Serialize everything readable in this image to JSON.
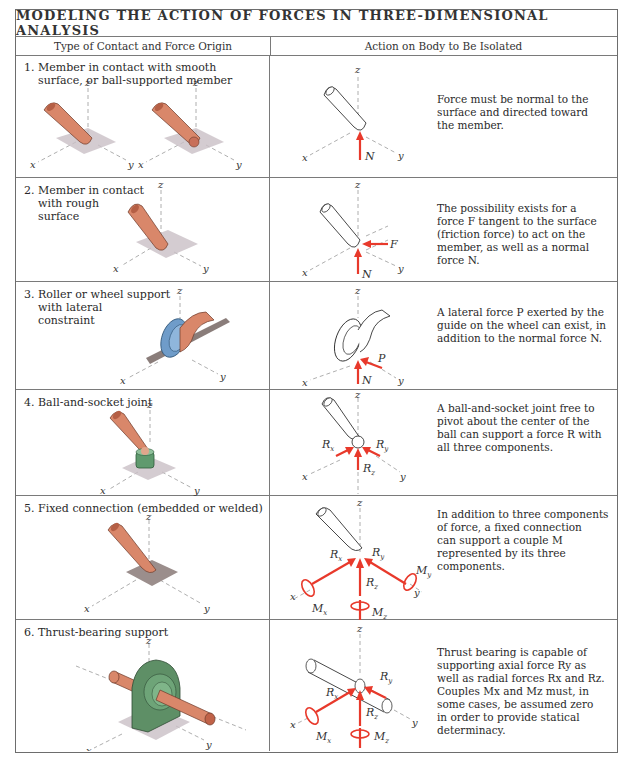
{
  "table": {
    "title": "MODELING THE ACTION OF FORCES IN THREE-DIMENSIONAL ANALYSIS",
    "headers": [
      "Type of Contact and Force Origin",
      "Action on Body to Be Isolated"
    ]
  },
  "rows": [
    {
      "number": "1.",
      "contact_lines": [
        "Member in contact with smooth",
        "surface, or ball-supported member"
      ],
      "action_lines": [
        "Force must be normal to the",
        "surface and directed toward",
        "the member."
      ],
      "forces": [
        "N"
      ],
      "axes": [
        "x",
        "y",
        "z"
      ]
    },
    {
      "number": "2.",
      "contact_lines": [
        "Member in contact",
        "with rough",
        "surface"
      ],
      "action_lines": [
        "The possibility exists for a",
        "force F tangent to the surface",
        "(friction force) to act on the",
        "member, as well as a normal",
        "force N."
      ],
      "forces": [
        "F",
        "N"
      ],
      "axes": [
        "x",
        "y",
        "z"
      ]
    },
    {
      "number": "3.",
      "contact_lines": [
        "Roller or wheel support",
        "with lateral",
        "constraint"
      ],
      "action_lines": [
        "A lateral force P exerted by the",
        "guide on the wheel can exist, in",
        "addition to the normal force N."
      ],
      "forces": [
        "P",
        "N"
      ],
      "axes": [
        "x",
        "y",
        "z"
      ]
    },
    {
      "number": "4.",
      "contact_lines": [
        "Ball-and-socket joint"
      ],
      "action_lines": [
        "A ball-and-socket joint free to",
        "pivot about the center of the",
        "ball can support a force R with",
        "all three components."
      ],
      "forces": [
        "Rx",
        "Ry",
        "Rz"
      ],
      "axes": [
        "x",
        "y",
        "z"
      ]
    },
    {
      "number": "5.",
      "contact_lines": [
        "Fixed connection (embedded or welded)"
      ],
      "action_lines": [
        "In addition to three components",
        "of force, a fixed connection",
        "can support a couple M",
        "represented by its three",
        "components."
      ],
      "forces": [
        "Rx",
        "Ry",
        "Rz",
        "Mx",
        "My",
        "Mz"
      ],
      "axes": [
        "x",
        "y",
        "z"
      ]
    },
    {
      "number": "6.",
      "contact_lines": [
        "Thrust-bearing support"
      ],
      "action_lines": [
        "Thrust bearing is capable of",
        "supporting axial force Ry as",
        "well as radial forces Rx and Rz.",
        "Couples Mx and Mz must, in",
        "some cases, be assumed zero",
        "in order to provide statical",
        "determinacy."
      ],
      "forces": [
        "Rx",
        "Ry",
        "Rz",
        "Mx",
        "Mz"
      ],
      "axes": [
        "x",
        "y",
        "z"
      ]
    }
  ],
  "colors": {
    "force_arrow": "#e8392b",
    "member_copper": "#d9876a",
    "surface_patch": "#c9bfc6",
    "roller_blue": "#6f9cc9",
    "socket_green": "#5f9a6e",
    "bearing_green": "#5e8f66",
    "border": "#6d6d6d"
  }
}
